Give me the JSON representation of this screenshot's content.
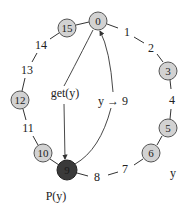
{
  "diagram": {
    "type": "chord-ring",
    "colors": {
      "node_fill": "#d2d2d2",
      "node_stroke": "#555555",
      "active_fill": "#3a3a3a",
      "text": "#222222"
    },
    "nodes": [
      {
        "id": "0",
        "label": "0",
        "x": 98,
        "y": 21,
        "active": false
      },
      {
        "id": "3",
        "label": "3",
        "x": 168,
        "y": 71,
        "active": false
      },
      {
        "id": "5",
        "label": "5",
        "x": 168,
        "y": 128,
        "active": false
      },
      {
        "id": "6",
        "label": "6",
        "x": 151,
        "y": 153,
        "active": false
      },
      {
        "id": "9",
        "label": "9",
        "x": 67,
        "y": 170,
        "active": true
      },
      {
        "id": "10",
        "label": "10",
        "x": 43,
        "y": 153,
        "active": false
      },
      {
        "id": "12",
        "label": "12",
        "x": 20,
        "y": 100,
        "active": false
      },
      {
        "id": "15",
        "label": "15",
        "x": 67,
        "y": 28,
        "active": false
      }
    ],
    "ring_labels": [
      {
        "label": "1",
        "x": 127,
        "y": 32
      },
      {
        "label": "2",
        "x": 151,
        "y": 48
      },
      {
        "label": "4",
        "x": 172,
        "y": 100
      },
      {
        "label": "7",
        "x": 125,
        "y": 169
      },
      {
        "label": "8",
        "x": 97,
        "y": 177
      },
      {
        "label": "11",
        "x": 28,
        "y": 128
      },
      {
        "label": "13",
        "x": 27,
        "y": 70
      },
      {
        "label": "14",
        "x": 41,
        "y": 45
      }
    ],
    "annotations": {
      "get": "get(y)",
      "map": "y → 9",
      "owner": "P(y)",
      "key": "y"
    }
  }
}
